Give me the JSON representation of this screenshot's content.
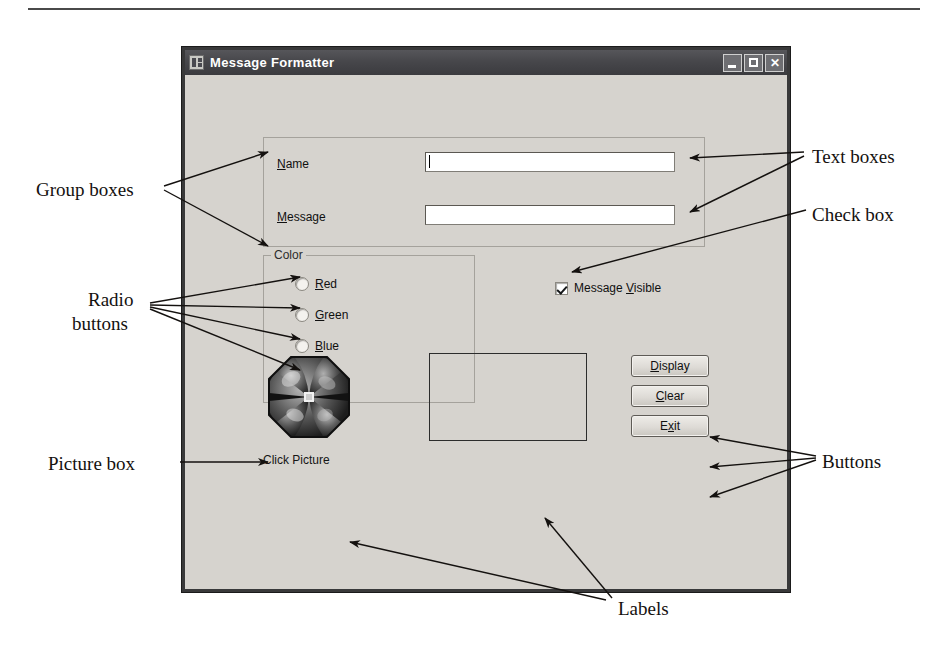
{
  "figure": {
    "annotations": [
      {
        "id": "text-boxes",
        "text": "Text boxes",
        "x": 812,
        "y": 145
      },
      {
        "id": "check-box",
        "text": "Check box",
        "x": 812,
        "y": 203
      },
      {
        "id": "group-boxes",
        "text": "Group boxes",
        "x": 36,
        "y": 178
      },
      {
        "id": "radio-line1",
        "text": "Radio",
        "x": 88,
        "y": 288
      },
      {
        "id": "radio-line2",
        "text": "buttons",
        "x": 72,
        "y": 312
      },
      {
        "id": "picture-box",
        "text": "Picture box",
        "x": 48,
        "y": 452
      },
      {
        "id": "buttons",
        "text": "Buttons",
        "x": 822,
        "y": 450
      },
      {
        "id": "labels",
        "text": "Labels",
        "x": 618,
        "y": 597
      }
    ]
  },
  "window": {
    "title": "Message Formatter",
    "icon": "application-icon",
    "controls": {
      "minimize": "minimize-button",
      "maximize": "maximize-button",
      "close": "close-button",
      "close_glyph": "✕"
    }
  },
  "form": {
    "fields_group": {
      "title": "",
      "name_label": {
        "accel": "N",
        "rest": "ame"
      },
      "name_value": "",
      "name_placeholder": "",
      "message_label": {
        "accel": "M",
        "rest": "essage"
      },
      "message_value": "",
      "message_placeholder": ""
    },
    "color_group": {
      "title": "Color",
      "options": [
        {
          "accel": "R",
          "rest": "ed",
          "label": "Red",
          "checked": false
        },
        {
          "accel": "G",
          "rest": "reen",
          "label": "Green",
          "checked": false
        },
        {
          "accel": "B",
          "rest": "lue",
          "label": "Blue",
          "checked": false
        },
        {
          "accel": "B",
          "rest": "lack",
          "label": "Black",
          "checked": true
        }
      ]
    },
    "checkbox": {
      "prefix": "Message ",
      "accel": "V",
      "rest": "isible",
      "label": "Message Visible",
      "checked": true
    },
    "buttons": [
      {
        "id": "display-button",
        "pre": "",
        "accel": "D",
        "post": "isplay"
      },
      {
        "id": "clear-button",
        "pre": "",
        "accel": "C",
        "post": "lear"
      },
      {
        "id": "exit-button",
        "pre": "E",
        "accel": "x",
        "post": "it"
      }
    ],
    "picture": {
      "caption": "Click Picture",
      "art": "flower-pinwheel-image"
    },
    "output_label": {
      "text": ""
    }
  },
  "colors": {
    "form_face": "#d6d3ce",
    "titlebar": "#47474b",
    "window_border": "#39393a",
    "text": "#101010",
    "annotation_text": "#14110f",
    "field_bg": "#ffffff"
  }
}
